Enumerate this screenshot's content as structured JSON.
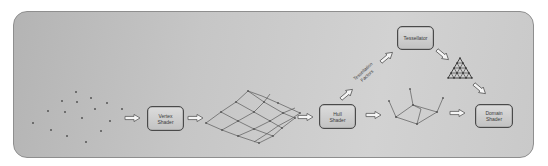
{
  "diagram": {
    "type": "graphics-pipeline-tessellation",
    "colors": {
      "panel_background": "#c4c4c4",
      "panel_border": "#8e8e8e",
      "box_fill": "#cfcfcf",
      "box_border": "#4a4a4a",
      "lines": "#555555",
      "arrow_fill": "#f2f2f2"
    },
    "stages": {
      "vertex_shader": "Vertex\nShader",
      "hull_shader": "Hull\nShader",
      "tessellator": "Tessellator",
      "domain_shader": "Domain\nShader"
    },
    "labels": {
      "tessellation_factors": "Tessellation\nFactors"
    },
    "illustrations": [
      {
        "name": "input-vertices",
        "description": "scattered point cloud"
      },
      {
        "name": "patch-grid",
        "description": "curved 4x4 quad patch mesh"
      },
      {
        "name": "control-points",
        "description": "control point cage with normals"
      },
      {
        "name": "tessellated-triangle",
        "description": "subdivided triangle domain"
      }
    ],
    "flow": [
      "input-vertices -> Vertex Shader",
      "Vertex Shader -> patch-grid",
      "patch-grid -> Hull Shader",
      "Hull Shader -> Tessellation Factors -> Tessellator",
      "Tessellator -> tessellated-triangle -> Domain Shader",
      "Hull Shader -> control-points -> Domain Shader"
    ]
  }
}
